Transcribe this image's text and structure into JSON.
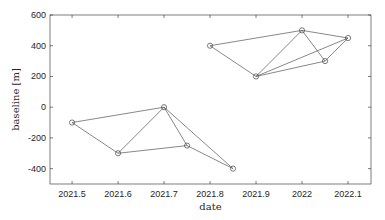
{
  "chart_data": {
    "type": "scatter",
    "title": "",
    "xlabel": "date",
    "ylabel": "baseline [m]",
    "xlim": [
      2021.452,
      2022.15
    ],
    "ylim": [
      -500,
      600
    ],
    "grid": false,
    "legend": null,
    "xticks": [
      2021.5,
      2021.6,
      2021.7,
      2021.8,
      2021.9,
      2022.0,
      2022.1
    ],
    "xtick_labels": [
      "2021.5",
      "2021.6",
      "2021.7",
      "2021.8",
      "2021.9",
      "2022",
      "2022.1"
    ],
    "yticks": [
      -400,
      -200,
      0,
      200,
      400,
      600
    ],
    "ytick_labels": [
      "-400",
      "-200",
      "0",
      "200",
      "400",
      "600"
    ],
    "marker": "circle-open",
    "line_color": "#555555",
    "points": [
      {
        "id": "A1",
        "x": 2021.5,
        "y": -100
      },
      {
        "id": "A2",
        "x": 2021.6,
        "y": -300
      },
      {
        "id": "A3",
        "x": 2021.7,
        "y": 0
      },
      {
        "id": "A4",
        "x": 2021.75,
        "y": -250
      },
      {
        "id": "A5",
        "x": 2021.85,
        "y": -400
      },
      {
        "id": "B1",
        "x": 2021.8,
        "y": 400
      },
      {
        "id": "B2",
        "x": 2021.9,
        "y": 200
      },
      {
        "id": "B3",
        "x": 2022.0,
        "y": 500
      },
      {
        "id": "B4",
        "x": 2022.05,
        "y": 300
      },
      {
        "id": "B5",
        "x": 2022.1,
        "y": 450
      }
    ],
    "edges": [
      [
        "A1",
        "A2"
      ],
      [
        "A1",
        "A3"
      ],
      [
        "A2",
        "A3"
      ],
      [
        "A2",
        "A4"
      ],
      [
        "A3",
        "A4"
      ],
      [
        "A3",
        "A5"
      ],
      [
        "A4",
        "A5"
      ],
      [
        "B1",
        "B2"
      ],
      [
        "B1",
        "B3"
      ],
      [
        "B2",
        "B3"
      ],
      [
        "B2",
        "B4"
      ],
      [
        "B2",
        "B5"
      ],
      [
        "B3",
        "B4"
      ],
      [
        "B3",
        "B5"
      ],
      [
        "B4",
        "B5"
      ]
    ]
  }
}
